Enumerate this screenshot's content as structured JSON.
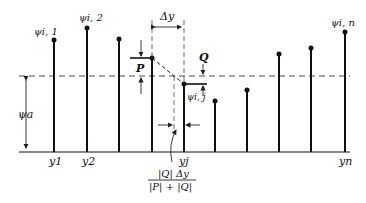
{
  "labels": {
    "psi_1": "ψi, 1",
    "psi_2": "ψi, 2",
    "psi_j": "ψi, j",
    "psi_n": "ψi, n",
    "psi_a": "ψa",
    "delta_y": "Δy",
    "P": "P",
    "Q": "Q",
    "y1": "y1",
    "y2": "y2",
    "yj": "yj",
    "yn": "yn",
    "formula_numerator": "|Q| Δy",
    "formula_denominator": "|P| + |Q|"
  },
  "colors": {
    "ink": "#111111",
    "background": "#ffffff"
  }
}
